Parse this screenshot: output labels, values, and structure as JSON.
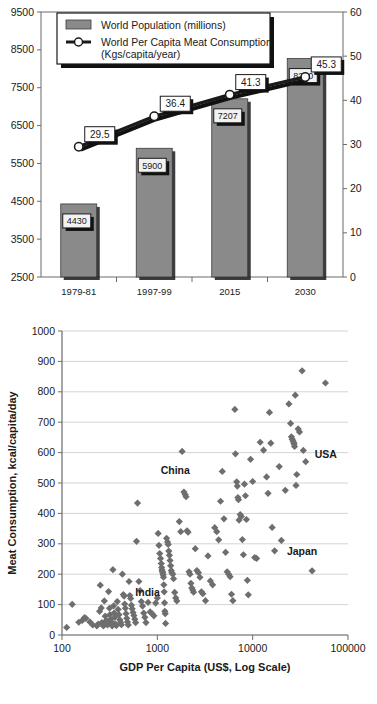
{
  "page": {
    "width": 377,
    "height": 704,
    "background": "#ffffff"
  },
  "colors": {
    "bar_fill": "#8a8a8a",
    "bar_shadow": "#1a1a1a",
    "line_color": "#1a1a1a",
    "marker_fill": "#ffffff",
    "marker_stroke": "#1a1a1a",
    "label_box_fill": "#f2f2f2",
    "label_box_stroke": "#1a1a1a",
    "scatter_marker": "#6e6e6e",
    "axis": "#6b6b6b",
    "gridline": "#d4d4d4",
    "text": "#1a1a1a"
  },
  "chart_data": [
    {
      "id": "population-meat-combo",
      "type": "bar",
      "title": "",
      "categories": [
        "1979-81",
        "1997-99",
        "2015",
        "2030"
      ],
      "xlabel": "",
      "ylabel": "",
      "ylim": [
        2500,
        9500
      ],
      "yticks": [
        "2500",
        "3500",
        "4500",
        "5500",
        "6500",
        "7500",
        "8500",
        "9500"
      ],
      "y2lim": [
        0,
        60
      ],
      "y2ticks": [
        "0",
        "10",
        "20",
        "30",
        "40",
        "50",
        "60"
      ],
      "grid": false,
      "legend_position": "top-left",
      "series": [
        {
          "name": "World Population (millions)",
          "kind": "bar",
          "axis": "left",
          "values": [
            4430,
            5900,
            7207,
            8270
          ],
          "labels": [
            "4430",
            "5900",
            "7207",
            "8270"
          ]
        },
        {
          "name": "World Per Capita Meat Consumption (Kgs/capita/year)",
          "kind": "line",
          "axis": "right",
          "values": [
            29.5,
            36.4,
            41.3,
            45.3
          ],
          "labels": [
            "29.5",
            "36.4",
            "41.3",
            "45.3"
          ]
        }
      ],
      "legend": [
        {
          "label": "World Population (millions)",
          "marker": "swatch"
        },
        {
          "label": "World Per Capita Meat Consumption",
          "label2": "(Kgs/capita/year)",
          "marker": "line-circle"
        }
      ]
    },
    {
      "id": "gdp-meat-scatter",
      "type": "scatter",
      "title": "",
      "xlabel": "GDP Per Capita (US$, Log Scale)",
      "ylabel": "Meat Consumption, kcal/capita/day",
      "xscale": "log",
      "xlim": [
        100,
        100000
      ],
      "xticks": [
        "100",
        "1000",
        "10000",
        "100000"
      ],
      "ylim": [
        0,
        1000
      ],
      "yticks": [
        "0",
        "100",
        "200",
        "300",
        "400",
        "500",
        "600",
        "700",
        "800",
        "900",
        "1000"
      ],
      "grid": true,
      "annotations": [
        {
          "text": "USA",
          "x": 36000,
          "y": 570
        },
        {
          "text": "China",
          "x": 1700,
          "y": 495
        },
        {
          "text": "Japan",
          "x": 33000,
          "y": 235
        },
        {
          "text": "India",
          "x": 560,
          "y": 125
        }
      ],
      "points": [
        [
          112,
          25
        ],
        [
          128,
          101
        ],
        [
          150,
          42
        ],
        [
          163,
          48
        ],
        [
          172,
          57
        ],
        [
          178,
          55
        ],
        [
          196,
          43
        ],
        [
          210,
          33
        ],
        [
          232,
          30
        ],
        [
          240,
          36
        ],
        [
          248,
          78
        ],
        [
          252,
          164
        ],
        [
          258,
          89
        ],
        [
          262,
          41
        ],
        [
          268,
          35
        ],
        [
          272,
          30
        ],
        [
          278,
          112
        ],
        [
          284,
          62
        ],
        [
          290,
          47
        ],
        [
          296,
          38
        ],
        [
          300,
          33
        ],
        [
          308,
          143
        ],
        [
          315,
          88
        ],
        [
          318,
          67
        ],
        [
          322,
          52
        ],
        [
          330,
          43
        ],
        [
          336,
          30
        ],
        [
          342,
          215
        ],
        [
          348,
          96
        ],
        [
          352,
          72
        ],
        [
          358,
          58
        ],
        [
          364,
          36
        ],
        [
          372,
          31
        ],
        [
          380,
          110
        ],
        [
          388,
          84
        ],
        [
          396,
          67
        ],
        [
          404,
          50
        ],
        [
          412,
          42
        ],
        [
          420,
          34
        ],
        [
          430,
          200
        ],
        [
          440,
          133
        ],
        [
          448,
          128
        ],
        [
          455,
          102
        ],
        [
          462,
          88
        ],
        [
          470,
          70
        ],
        [
          478,
          55
        ],
        [
          486,
          43
        ],
        [
          495,
          33
        ],
        [
          505,
          176
        ],
        [
          515,
          130
        ],
        [
          525,
          120
        ],
        [
          535,
          98
        ],
        [
          545,
          86
        ],
        [
          556,
          74
        ],
        [
          568,
          64
        ],
        [
          580,
          52
        ],
        [
          592,
          41
        ],
        [
          605,
          308
        ],
        [
          620,
          434
        ],
        [
          640,
          176
        ],
        [
          660,
          146
        ],
        [
          680,
          110
        ],
        [
          700,
          95
        ],
        [
          720,
          72
        ],
        [
          740,
          58
        ],
        [
          760,
          41
        ],
        [
          800,
          107
        ],
        [
          840,
          76
        ],
        [
          880,
          70
        ],
        [
          920,
          63
        ],
        [
          960,
          105
        ],
        [
          1000,
          122
        ],
        [
          1020,
          334
        ],
        [
          1040,
          295
        ],
        [
          1060,
          268
        ],
        [
          1080,
          252
        ],
        [
          1100,
          235
        ],
        [
          1110,
          222
        ],
        [
          1120,
          214
        ],
        [
          1130,
          208
        ],
        [
          1140,
          205
        ],
        [
          1150,
          198
        ],
        [
          1160,
          190
        ],
        [
          1170,
          165
        ],
        [
          1180,
          142
        ],
        [
          1190,
          106
        ],
        [
          1200,
          78
        ],
        [
          1210,
          70
        ],
        [
          1220,
          38
        ],
        [
          1250,
          318
        ],
        [
          1280,
          306
        ],
        [
          1300,
          298
        ],
        [
          1320,
          276
        ],
        [
          1340,
          262
        ],
        [
          1360,
          245
        ],
        [
          1380,
          228
        ],
        [
          1400,
          212
        ],
        [
          1420,
          205
        ],
        [
          1450,
          200
        ],
        [
          1480,
          185
        ],
        [
          1520,
          140
        ],
        [
          1560,
          122
        ],
        [
          1600,
          112
        ],
        [
          1700,
          373
        ],
        [
          1760,
          340
        ],
        [
          1820,
          604
        ],
        [
          1900,
          470
        ],
        [
          1960,
          462
        ],
        [
          2000,
          455
        ],
        [
          2050,
          343
        ],
        [
          2100,
          338
        ],
        [
          2150,
          208
        ],
        [
          2200,
          200
        ],
        [
          2250,
          170
        ],
        [
          2300,
          155
        ],
        [
          2350,
          148
        ],
        [
          2400,
          141
        ],
        [
          2500,
          284
        ],
        [
          2600,
          212
        ],
        [
          2700,
          205
        ],
        [
          2800,
          190
        ],
        [
          2900,
          142
        ],
        [
          3000,
          136
        ],
        [
          3200,
          113
        ],
        [
          3400,
          260
        ],
        [
          3600,
          178
        ],
        [
          3800,
          165
        ],
        [
          4000,
          353
        ],
        [
          4200,
          340
        ],
        [
          4400,
          313
        ],
        [
          4600,
          440
        ],
        [
          4800,
          538
        ],
        [
          5000,
          382
        ],
        [
          5200,
          272
        ],
        [
          5400,
          208
        ],
        [
          5600,
          200
        ],
        [
          5800,
          192
        ],
        [
          6000,
          134
        ],
        [
          6200,
          113
        ],
        [
          6500,
          742
        ],
        [
          6600,
          596
        ],
        [
          6800,
          504
        ],
        [
          6900,
          490
        ],
        [
          7000,
          452
        ],
        [
          7100,
          445
        ],
        [
          7200,
          378
        ],
        [
          7400,
          396
        ],
        [
          7600,
          390
        ],
        [
          7800,
          314
        ],
        [
          8000,
          264
        ],
        [
          8200,
          496
        ],
        [
          8400,
          458
        ],
        [
          8600,
          380
        ],
        [
          8800,
          180
        ],
        [
          9000,
          132
        ],
        [
          9500,
          578
        ],
        [
          10000,
          505
        ],
        [
          10500,
          255
        ],
        [
          11000,
          252
        ],
        [
          12000,
          634
        ],
        [
          13000,
          608
        ],
        [
          14000,
          520
        ],
        [
          14500,
          466
        ],
        [
          15000,
          732
        ],
        [
          15500,
          631
        ],
        [
          16000,
          354
        ],
        [
          17000,
          277
        ],
        [
          19000,
          554
        ],
        [
          20000,
          311
        ],
        [
          22000,
          476
        ],
        [
          24000,
          760
        ],
        [
          25000,
          696
        ],
        [
          25500,
          652
        ],
        [
          26000,
          644
        ],
        [
          26500,
          638
        ],
        [
          27000,
          632
        ],
        [
          27200,
          628
        ],
        [
          27500,
          620
        ],
        [
          28000,
          789
        ],
        [
          28500,
          492
        ],
        [
          29000,
          528
        ],
        [
          30000,
          678
        ],
        [
          31000,
          668
        ],
        [
          33000,
          869
        ],
        [
          34000,
          607
        ],
        [
          36000,
          570
        ],
        [
          42000,
          211
        ],
        [
          58000,
          829
        ]
      ]
    }
  ]
}
